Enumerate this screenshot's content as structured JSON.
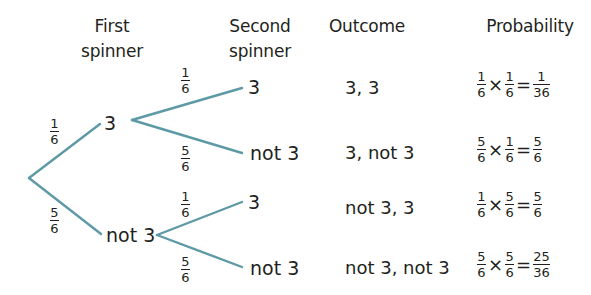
{
  "headers": {
    "first_spinner": [
      "First",
      "spinner"
    ],
    "second_spinner": [
      "Second",
      "spinner"
    ],
    "outcome": "Outcome",
    "probability": "Probability"
  },
  "tree": {
    "line_color": "#5d9aa5",
    "first_level": [
      {
        "label": "3",
        "branch_prob": {
          "num": "1",
          "den": "6"
        }
      },
      {
        "label": "not 3",
        "branch_prob": {
          "num": "5",
          "den": "6"
        }
      }
    ],
    "second_level": [
      {
        "parent": "3",
        "label": "3",
        "branch_prob": {
          "num": "1",
          "den": "6"
        }
      },
      {
        "parent": "3",
        "label": "not 3",
        "branch_prob": {
          "num": "5",
          "den": "6"
        }
      },
      {
        "parent": "not 3",
        "label": "3",
        "branch_prob": {
          "num": "1",
          "den": "6"
        }
      },
      {
        "parent": "not 3",
        "label": "not 3",
        "branch_prob": {
          "num": "5",
          "den": "6"
        }
      }
    ]
  },
  "rows": [
    {
      "outcome": "3, 3",
      "a": {
        "num": "1",
        "den": "6"
      },
      "b": {
        "num": "1",
        "den": "6"
      },
      "result": {
        "num": "1",
        "den": "36"
      }
    },
    {
      "outcome": "3, not 3",
      "a": {
        "num": "5",
        "den": "6"
      },
      "b": {
        "num": "1",
        "den": "6"
      },
      "result": {
        "num": "5",
        "den": "6"
      }
    },
    {
      "outcome": "not 3, 3",
      "a": {
        "num": "1",
        "den": "6"
      },
      "b": {
        "num": "5",
        "den": "6"
      },
      "result": {
        "num": "5",
        "den": "6"
      }
    },
    {
      "outcome": "not 3, not 3",
      "a": {
        "num": "5",
        "den": "6"
      },
      "b": {
        "num": "5",
        "den": "6"
      },
      "result": {
        "num": "25",
        "den": "36"
      }
    }
  ],
  "symbols": {
    "times": "×",
    "equals": "="
  }
}
